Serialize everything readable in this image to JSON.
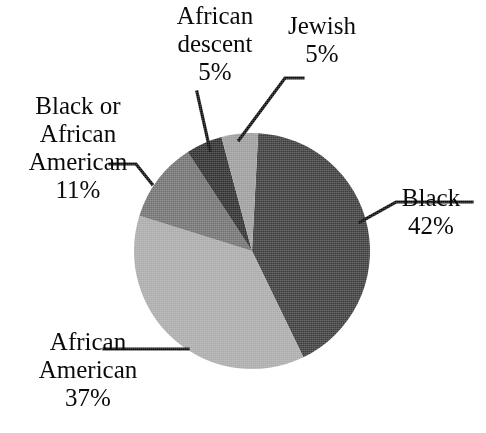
{
  "chart_data": {
    "type": "pie",
    "title": "",
    "subtitle": "",
    "xlabel": "",
    "ylabel": "",
    "legend_position": "none",
    "labels_position": "outside-with-leader-lines",
    "grid": false,
    "units": "percent",
    "total": 100,
    "categories": [
      "Black",
      "African American",
      "Black or African American",
      "African descent",
      "Jewish"
    ],
    "values": [
      42,
      37,
      11,
      5,
      5
    ],
    "slices": [
      {
        "label": "Black",
        "value": 42,
        "value_text": "42%",
        "color": "#3a3a3a",
        "start_angle_deg": 3,
        "end_angle_deg": 154,
        "label_side": "right"
      },
      {
        "label": "African American",
        "value": 37,
        "value_text": "37%",
        "color": "#a9a9a9",
        "start_angle_deg": 154,
        "end_angle_deg": 287,
        "label_side": "bottom-left"
      },
      {
        "label": "Black or African American",
        "value": 11,
        "value_text": "11%",
        "color": "#6f6f6f",
        "start_angle_deg": 287,
        "end_angle_deg": 327,
        "label_side": "left"
      },
      {
        "label": "African descent",
        "value": 5,
        "value_text": "5%",
        "color": "#2b2b2b",
        "start_angle_deg": 327,
        "end_angle_deg": 345,
        "label_side": "top"
      },
      {
        "label": "Jewish",
        "value": 5,
        "value_text": "5%",
        "color": "#9b9b9b",
        "start_angle_deg": 345,
        "end_angle_deg": 363,
        "label_side": "top-right"
      }
    ]
  },
  "labels": {
    "african_descent": {
      "line1": "African",
      "line2": "descent",
      "percent": "5%"
    },
    "jewish": {
      "line1": "Jewish",
      "percent": "5%"
    },
    "black_or_african_american": {
      "line1": "Black or",
      "line2": "African",
      "line3": "American",
      "percent": "11%"
    },
    "black": {
      "line1": "Black",
      "percent": "42%"
    },
    "african_american": {
      "line1": "African",
      "line2": "American",
      "percent": "37%"
    }
  },
  "colors": {
    "background": "#ffffff",
    "text": "#0a0a0a",
    "leader_line": "#0a0a0a",
    "slice_black": "#3a3a3a",
    "slice_african_american": "#a9a9a9",
    "slice_black_or_african_american": "#6f6f6f",
    "slice_african_descent": "#2b2b2b",
    "slice_jewish": "#9b9b9b"
  }
}
